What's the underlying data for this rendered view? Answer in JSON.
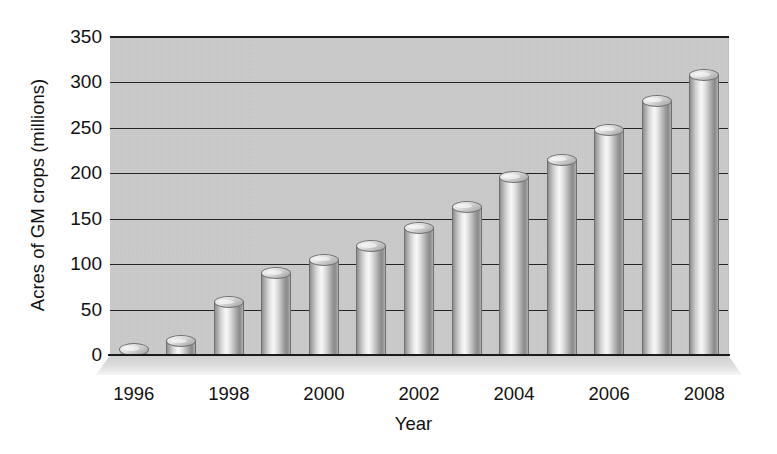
{
  "chart_data": {
    "type": "bar",
    "title": "",
    "xlabel": "Year",
    "ylabel": "Acres of GM crops (millions)",
    "categories": [
      "1996",
      "1997",
      "1998",
      "1999",
      "2000",
      "2001",
      "2002",
      "2003",
      "2004",
      "2005",
      "2006",
      "2007",
      "2008"
    ],
    "values": [
      4,
      15,
      58,
      90,
      105,
      120,
      140,
      163,
      196,
      215,
      248,
      280,
      308
    ],
    "ylim": [
      0,
      350
    ],
    "yticks": [
      0,
      50,
      100,
      150,
      200,
      250,
      300,
      350
    ],
    "ytick_labels": [
      "0",
      "50",
      "100",
      "150",
      "200",
      "250",
      "300",
      "350"
    ],
    "xtick_labels": [
      "1996",
      "1998",
      "2000",
      "2002",
      "2004",
      "2006",
      "2008"
    ],
    "xtick_categories": [
      "1996",
      "1998",
      "2000",
      "2002",
      "2004",
      "2006",
      "2008"
    ],
    "grid": true,
    "legend": false,
    "legend_position": "none",
    "style": "3d-cylinder",
    "colors": {
      "plot_background": "#c3c3c3",
      "gridline": "#242424",
      "axis": "#1b1b1b",
      "bar_light": "#f7f7f7",
      "bar_mid": "#c4c4c4",
      "bar_dark": "#8a8a8a",
      "page_background": "#ffffff",
      "text": "#111111"
    }
  }
}
